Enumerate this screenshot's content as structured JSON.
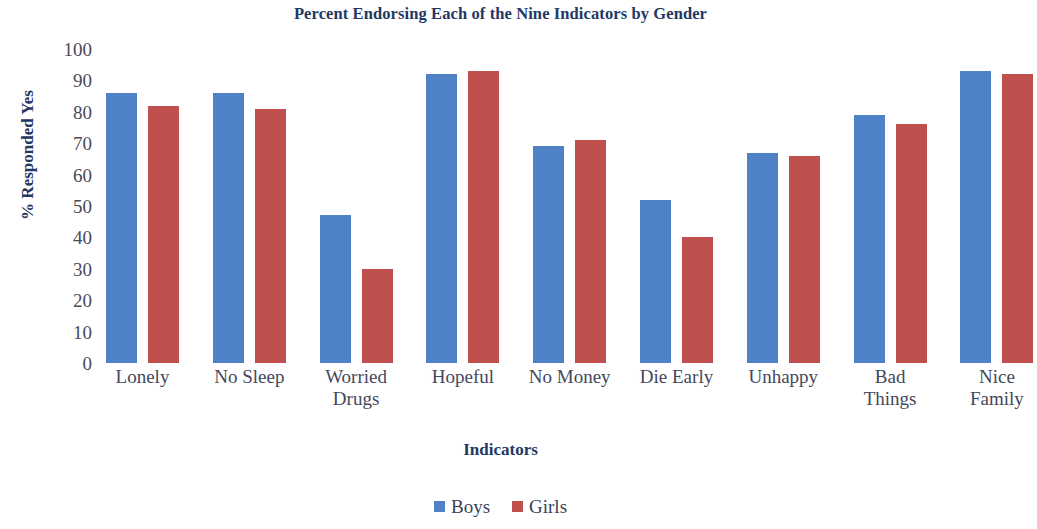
{
  "chart_data": {
    "type": "bar",
    "title": "Percent Endorsing Each of the Nine Indicators by Gender",
    "xlabel": "Indicators",
    "ylabel": "% Responded Yes",
    "ylim": [
      0,
      100
    ],
    "ytick_step": 10,
    "yticks": [
      "100",
      "90",
      "80",
      "70",
      "60",
      "50",
      "40",
      "30",
      "20",
      "10",
      "0"
    ],
    "grid": false,
    "legend_position": "bottom",
    "categories": [
      "Lonely",
      "No Sleep",
      "Worried Drugs",
      "Hopeful",
      "No Money",
      "Die Early",
      "Unhappy",
      "Bad Things",
      "Nice Family"
    ],
    "category_lines": [
      [
        "Lonely"
      ],
      [
        "No Sleep"
      ],
      [
        "Worried",
        "Drugs"
      ],
      [
        "Hopeful"
      ],
      [
        "No Money"
      ],
      [
        "Die Early"
      ],
      [
        "Unhappy"
      ],
      [
        "Bad",
        "Things"
      ],
      [
        "Nice",
        "Family"
      ]
    ],
    "series": [
      {
        "name": "Boys",
        "color": "#4f81c7",
        "values": [
          86,
          86,
          47,
          92,
          69,
          52,
          67,
          79,
          93
        ]
      },
      {
        "name": "Girls",
        "color": "#c0504d",
        "values": [
          82,
          81,
          30,
          93,
          71,
          40,
          66,
          76,
          92
        ]
      }
    ]
  },
  "legend": {
    "items": [
      {
        "label": "Boys",
        "color": "#4f81c7"
      },
      {
        "label": "Girls",
        "color": "#c0504d"
      }
    ]
  }
}
